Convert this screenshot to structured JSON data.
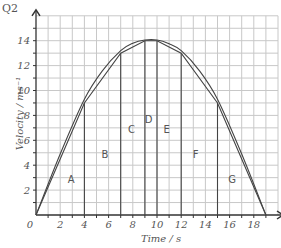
{
  "question_label": "Q2",
  "chart_data": {
    "type": "line",
    "title": "",
    "xlabel": "Time / s",
    "ylabel": "Velocity / ms⁻¹",
    "xlim": [
      0,
      20
    ],
    "ylim": [
      0,
      16
    ],
    "grid": true,
    "x_ticks": [
      2,
      4,
      6,
      8,
      10,
      12,
      14,
      16,
      18
    ],
    "y_ticks": [
      2,
      4,
      6,
      8,
      10,
      12,
      14
    ],
    "origin_label": "0",
    "series": [
      {
        "name": "straight-line approximation (trapezia)",
        "x": [
          0,
          4,
          7,
          9,
          10,
          12,
          15,
          19
        ],
        "y": [
          0,
          9,
          13,
          14,
          14,
          13,
          9,
          0
        ]
      },
      {
        "name": "velocity curve",
        "x": [
          0,
          2,
          4,
          5.5,
          7,
          8,
          9,
          10,
          11,
          12,
          13.5,
          15,
          17,
          19
        ],
        "y": [
          0,
          4.9,
          9.3,
          11.6,
          13.2,
          13.8,
          14.05,
          14.05,
          13.75,
          13.2,
          11.6,
          9.3,
          4.9,
          0
        ]
      }
    ],
    "vertical_lines_at": [
      4,
      7,
      9,
      10,
      12,
      15
    ],
    "region_labels": [
      {
        "label": "A",
        "x": 2.9,
        "y": 2.6
      },
      {
        "label": "B",
        "x": 5.7,
        "y": 4.6
      },
      {
        "label": "C",
        "x": 7.9,
        "y": 6.6
      },
      {
        "label": "D",
        "x": 9.3,
        "y": 7.4
      },
      {
        "label": "E",
        "x": 10.8,
        "y": 6.6
      },
      {
        "label": "F",
        "x": 13.2,
        "y": 4.6
      },
      {
        "label": "G",
        "x": 16.2,
        "y": 2.6
      }
    ]
  },
  "colors": {
    "grid": "#c8c8c8",
    "axis": "#333333",
    "lines": "#444444",
    "text": "#555555"
  }
}
